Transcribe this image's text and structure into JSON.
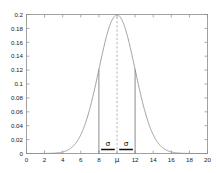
{
  "figure": {
    "background_color": "#ffffff",
    "frame_color": "#8a8a8a",
    "curve_color": "#8e8e8e",
    "annotation_color": "#111111",
    "width_px": 216,
    "height_px": 173
  },
  "chart_data": {
    "type": "line",
    "title": "",
    "subtitle": "",
    "xlabel": "",
    "ylabel": "",
    "xlim": [
      0,
      20
    ],
    "ylim": [
      0,
      0.2
    ],
    "grid": false,
    "legend": null,
    "legend_position": "none",
    "distribution": {
      "name": "normal",
      "mean": 10,
      "sigma": 2,
      "peak_value": 0.1995,
      "value_at_one_sigma": 0.121
    },
    "x_tick_labels": [
      "0",
      "2",
      "4",
      "6",
      "8",
      "μ",
      "12",
      "14",
      "16",
      "18",
      "20"
    ],
    "x_tick_values": [
      0,
      2,
      4,
      6,
      8,
      10,
      12,
      14,
      16,
      18,
      20
    ],
    "y_tick_labels": [
      "0",
      "0.02",
      "0.04",
      "0.06",
      "0.08",
      "0.1",
      "0.12",
      "0.14",
      "0.16",
      "0.18",
      "0.2"
    ],
    "y_tick_values": [
      0,
      0.02,
      0.04,
      0.06,
      0.08,
      0.1,
      0.12,
      0.14,
      0.16,
      0.18,
      0.2
    ],
    "series": [
      {
        "name": "normal-pdf",
        "x": [
          0,
          0.5,
          1,
          1.5,
          2,
          2.5,
          3,
          3.5,
          4,
          4.5,
          5,
          5.5,
          6,
          6.5,
          7,
          7.5,
          8,
          8.5,
          9,
          9.5,
          10,
          10.5,
          11,
          11.5,
          12,
          12.5,
          13,
          13.5,
          14,
          14.5,
          15,
          15.5,
          16,
          16.5,
          17,
          17.5,
          18,
          18.5,
          19,
          19.5,
          20
        ],
        "values": [
          0.0,
          0.0,
          0.0,
          0.0001,
          0.0002,
          0.0004,
          0.0009,
          0.0018,
          0.0033,
          0.0058,
          0.0088,
          0.013,
          0.018,
          0.0235,
          0.0302,
          0.0373,
          0.044,
          0.0519,
          0.0605,
          0.0668,
          0.0699,
          0.0668,
          0.0605,
          0.0519,
          0.044,
          0.0373,
          0.0302,
          0.0235,
          0.018,
          0.013,
          0.0088,
          0.0058,
          0.0033,
          0.0018,
          0.0009,
          0.0004,
          0.0002,
          0.0001,
          0.0,
          0.0,
          0.0
        ]
      }
    ],
    "annotations": [
      {
        "id": "center-line",
        "kind": "vertical-dashed-line",
        "x": 10,
        "y_from": 0,
        "y_to": 0.1995,
        "label": ""
      },
      {
        "id": "left-sigma-boundary",
        "kind": "vertical-line",
        "x": 8,
        "y_from": 0,
        "y_to": 0.121,
        "label": ""
      },
      {
        "id": "right-sigma-boundary",
        "kind": "vertical-line",
        "x": 12,
        "y_from": 0,
        "y_to": 0.121,
        "label": ""
      },
      {
        "id": "left-sigma-span",
        "kind": "span-bar",
        "x_from": 8,
        "x_to": 10,
        "label": "σ"
      },
      {
        "id": "right-sigma-span",
        "kind": "span-bar",
        "x_from": 10,
        "x_to": 12,
        "label": "σ"
      }
    ]
  },
  "labels": {
    "sigma_left": "σ",
    "sigma_right": "σ",
    "mu_axis": "μ"
  }
}
